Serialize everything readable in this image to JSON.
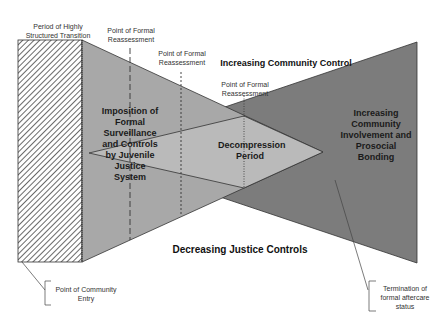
{
  "labels": {
    "structured_transition": "Period of Highly Structured Transition",
    "reassessment_1": "Point of Formal Reassessment",
    "reassessment_2": "Point of Formal Reassessment",
    "reassessment_3": "Point of Formal Reassessment",
    "increasing_community_control": "Increasing Community Control",
    "decreasing_justice_controls": "Decreasing Justice Controls",
    "imposition": "Imposition of Formal Surveillance and Controls by Juvenile Justice System",
    "decompression": "Decompression Period",
    "community_involvement": "Increasing Community Involvement and Prosocial Bonding",
    "community_entry": "Point of Community Entry",
    "termination": "Termination of formal aftercare status"
  },
  "colors": {
    "justice_region": "#a9a9a9",
    "community_region": "#7a7a7a",
    "decompression_region": "#b8b8b8",
    "hatch": "#555555",
    "stroke": "#222222"
  }
}
